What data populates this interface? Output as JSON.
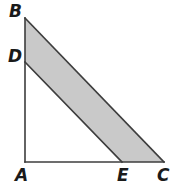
{
  "figure": {
    "kind": "geometry-diagram",
    "background_color": "#ffffff",
    "stroke_color": "#3d3d3d",
    "shaded_fill_color": "#c9c9c9",
    "stroke_width": 1.6,
    "labels": [
      {
        "id": "B",
        "text": "B"
      },
      {
        "id": "D",
        "text": "D"
      },
      {
        "id": "A",
        "text": "A"
      },
      {
        "id": "E",
        "text": "E"
      },
      {
        "id": "C",
        "text": "C"
      }
    ],
    "points": {
      "A": {
        "x": 25,
        "y": 162
      },
      "B": {
        "x": 25,
        "y": 18
      },
      "C": {
        "x": 164,
        "y": 162
      },
      "D": {
        "x": 25,
        "y": 62
      },
      "E": {
        "x": 122,
        "y": 162
      }
    },
    "segments": [
      {
        "name": "AB",
        "from": "A",
        "to": "B"
      },
      {
        "name": "AC",
        "from": "A",
        "to": "C"
      },
      {
        "name": "BC",
        "from": "B",
        "to": "C"
      },
      {
        "name": "DE",
        "from": "D",
        "to": "E"
      }
    ],
    "shaded_region": {
      "name": "BDEC",
      "vertices": [
        "B",
        "D",
        "E",
        "C"
      ]
    }
  }
}
